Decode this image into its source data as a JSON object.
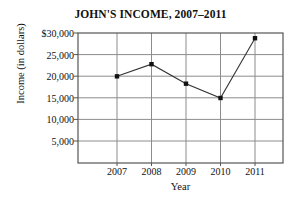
{
  "chart_data": {
    "type": "line",
    "title": "JOHN'S INCOME, 2007–2011",
    "xlabel": "Year",
    "ylabel": "Income (in dollars)",
    "categories": [
      "2007",
      "2008",
      "2009",
      "2010",
      "2011"
    ],
    "values": [
      20000,
      22800,
      18300,
      15000,
      28800
    ],
    "series": [
      {
        "name": "John's income",
        "values": [
          20000,
          22800,
          18300,
          15000,
          28800
        ]
      }
    ],
    "ylim": [
      0,
      30000
    ],
    "yticks": [
      5000,
      10000,
      15000,
      20000,
      25000,
      30000
    ],
    "ytick_labels": [
      "5,000",
      "10,000",
      "15,000",
      "20,000",
      "25,000",
      "$30,000"
    ],
    "xtick_labels": [
      "2007",
      "2008",
      "2009",
      "2010",
      "2011"
    ],
    "grid": true,
    "legend": "none",
    "marker": "filled-square",
    "line_color": "#333333",
    "marker_color": "#111111",
    "grid_color": "#8c8c8c",
    "axis_color": "#555555",
    "background": "#ffffff"
  }
}
